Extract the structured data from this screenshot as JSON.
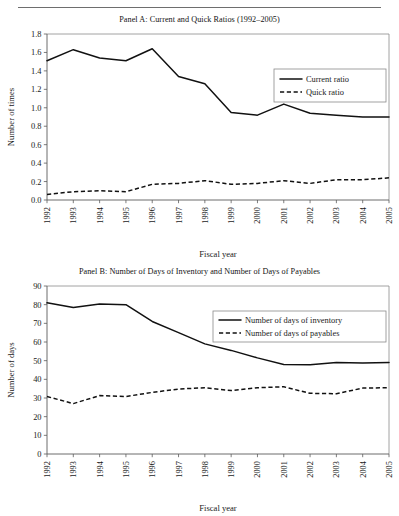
{
  "figure": {
    "panels": [
      "panel_a",
      "panel_b"
    ]
  },
  "panel_a": {
    "title": "Panel A: Current and Quick Ratios (1992–2005)",
    "chart_data": {
      "type": "line",
      "title": "Panel A: Current and Quick Ratios (1992–2005)",
      "xlabel": "Fiscal year",
      "ylabel": "Number of times",
      "categories": [
        "1992",
        "1993",
        "1994",
        "1995",
        "1996",
        "1997",
        "1998",
        "1999",
        "2000",
        "2001",
        "2002",
        "2003",
        "2004",
        "2005"
      ],
      "xtick_labels": [
        "1992",
        "1993",
        "1994",
        "1995",
        "1996",
        "1997",
        "1998",
        "1999",
        "2000",
        "2001",
        "2002",
        "2003",
        "2004",
        "2005"
      ],
      "ytick_labels": [
        "0.0",
        "0.2",
        "0.4",
        "0.6",
        "0.8",
        "1.0",
        "1.2",
        "1.4",
        "1.6",
        "1.8"
      ],
      "yticks": [
        0.0,
        0.2,
        0.4,
        0.6,
        0.8,
        1.0,
        1.2,
        1.4,
        1.6,
        1.8
      ],
      "ylim": [
        0.0,
        1.8
      ],
      "grid": false,
      "legend_position": "top-right",
      "series": [
        {
          "name": "Current ratio",
          "style": "solid",
          "values": [
            1.51,
            1.63,
            1.54,
            1.51,
            1.64,
            1.34,
            1.26,
            0.95,
            0.92,
            1.04,
            0.94,
            0.92,
            0.9,
            0.9
          ]
        },
        {
          "name": "Quick ratio",
          "style": "dashed",
          "values": [
            0.06,
            0.09,
            0.1,
            0.09,
            0.17,
            0.18,
            0.21,
            0.17,
            0.18,
            0.21,
            0.18,
            0.22,
            0.22,
            0.24
          ]
        }
      ]
    }
  },
  "panel_b": {
    "title": "Panel B: Number of Days of Inventory and Number of Days of Payables",
    "chart_data": {
      "type": "line",
      "title": "Panel B: Number of Days of Inventory and Number of Days of Payables",
      "xlabel": "Fiscal year",
      "ylabel": "Number of days",
      "categories": [
        "1992",
        "1993",
        "1994",
        "1995",
        "1996",
        "1997",
        "1998",
        "1999",
        "2000",
        "2001",
        "2002",
        "2003",
        "2004",
        "2005"
      ],
      "xtick_labels": [
        "1992",
        "1993",
        "1994",
        "1995",
        "1996",
        "1997",
        "1998",
        "1999",
        "2000",
        "2001",
        "2002",
        "2003",
        "2004",
        "2005"
      ],
      "ytick_labels": [
        "0",
        "10",
        "20",
        "30",
        "40",
        "50",
        "60",
        "70",
        "80",
        "90"
      ],
      "yticks": [
        0,
        10,
        20,
        30,
        40,
        50,
        60,
        70,
        80,
        90
      ],
      "ylim": [
        0,
        90
      ],
      "grid": false,
      "legend_position": "top-right",
      "series": [
        {
          "name": "Number of days of inventory",
          "style": "solid",
          "values": [
            81.0,
            78.5,
            80.3,
            80.0,
            71.0,
            65.0,
            59.0,
            55.5,
            51.5,
            48.0,
            47.8,
            49.0,
            48.8,
            49.0
          ]
        },
        {
          "name": "Number of days of payables",
          "style": "dashed",
          "values": [
            30.8,
            27.0,
            31.3,
            30.8,
            33.0,
            34.8,
            35.5,
            34.0,
            35.5,
            36.0,
            32.5,
            32.3,
            35.3,
            35.5
          ]
        }
      ]
    }
  }
}
